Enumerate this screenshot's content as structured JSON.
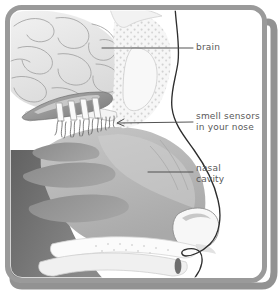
{
  "figure": {
    "type": "anatomical-cross-section",
    "background_color": "#ffffff",
    "frame": {
      "border_color": "#9a9a9a",
      "shadow_color": "#7d7d7d",
      "corner_radius_px": 14
    },
    "palette": {
      "outline": "#2b2b2b",
      "brain_fill": "#e8e8e8",
      "brain_line": "#9c9c9c",
      "bone_fill": "#f4f4f4",
      "bone_stipple": "#cfcfcf",
      "cavity_fill": "#b9b9b9",
      "turbinate_fill": "#8f8f8f",
      "dark_tissue": "#6d6d6d",
      "olfactory_bulb": "#8a8a8a",
      "label_text": "#595959",
      "leader_line": "#4a4a4a"
    }
  },
  "labels": [
    {
      "id": "brain",
      "name": "brain",
      "lines": [
        "brain"
      ],
      "text": "brain",
      "x": 196,
      "y": 42,
      "leader": {
        "from_x": 193,
        "from_y": 48,
        "to_x": 102,
        "to_y": 48,
        "arrow": false
      }
    },
    {
      "id": "smell-sensors",
      "name": "smell sensors in your nose",
      "lines": [
        "smell sensors",
        "in your nose"
      ],
      "line1": "smell sensors",
      "line2": "in your nose",
      "x": 196,
      "y": 111,
      "leader": {
        "from_x": 193,
        "from_y": 122,
        "to_x": 116,
        "to_y": 123,
        "arrow": true
      }
    },
    {
      "id": "nasal-cavity",
      "name": "nasal cavity",
      "lines": [
        "nasal",
        "cavity"
      ],
      "line1": "nasal",
      "line2": "cavity",
      "x": 196,
      "y": 163,
      "leader": {
        "from_x": 193,
        "from_y": 172,
        "to_x": 148,
        "to_y": 172,
        "arrow": false
      }
    }
  ],
  "structures": [
    {
      "name": "brain",
      "description": "cerebral gyri with curved outlines, upper left"
    },
    {
      "name": "frontal-sinus",
      "description": "stippled bone with air space, upper middle"
    },
    {
      "name": "olfactory-bulb",
      "description": "elongated dark shape above cribriform plate"
    },
    {
      "name": "olfactory-nerve-fibers",
      "description": "vertical bundles passing through cribriform plate"
    },
    {
      "name": "olfactory-epithelium",
      "description": "hair-like sensory cilia below cribriform plate"
    },
    {
      "name": "nasal-cavity",
      "description": "large gray open airway"
    },
    {
      "name": "superior-turbinate",
      "description": "upper curved gray shelf"
    },
    {
      "name": "middle-turbinate",
      "description": "middle curved gray shelf"
    },
    {
      "name": "inferior-turbinate",
      "description": "lower curved gray shelf"
    },
    {
      "name": "nostril",
      "description": "rounded opening at nose tip"
    },
    {
      "name": "hard-palate",
      "description": "bone shelf separating nose and mouth"
    },
    {
      "name": "tongue",
      "description": "dark mass in lower region"
    },
    {
      "name": "face-profile",
      "description": "dark outline of forehead, nose bridge, tip and lip"
    }
  ]
}
